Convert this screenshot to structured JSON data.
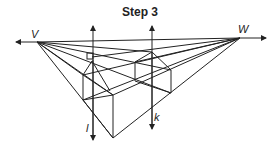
{
  "title": "Step 3",
  "labels": {
    "vanishing_left": "V",
    "vanishing_right": "W",
    "vertical_left": "l",
    "vertical_right": "k"
  },
  "colors": {
    "stroke": "#222222",
    "background": "#ffffff"
  }
}
